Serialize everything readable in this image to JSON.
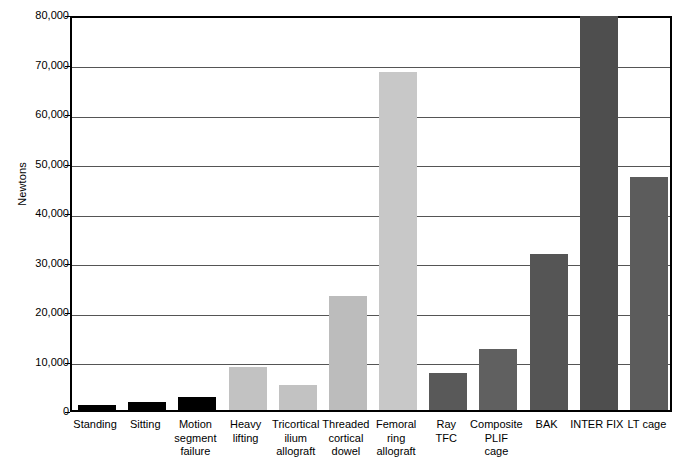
{
  "chart_data": {
    "type": "bar",
    "title": "",
    "xlabel": "",
    "ylabel": "Newtons",
    "ylim": [
      0,
      80000
    ],
    "grid": true,
    "legend": "none",
    "y_ticks": [
      "0",
      "10,000",
      "20,000",
      "30,000",
      "40,000",
      "50,000",
      "60,000",
      "70,000",
      "80,000"
    ],
    "y_tick_values": [
      0,
      10000,
      20000,
      30000,
      40000,
      50000,
      60000,
      70000,
      80000
    ],
    "categories": [
      "Standing",
      "Sitting",
      "Motion\nsegment\nfailure",
      "Heavy\nlifting",
      "Tricortical\nilium\nallograft",
      "Threaded\ncortical\ndowel",
      "Femoral\nring\nallograft",
      "Ray\nTFC",
      "Composite\nPLIF\ncage",
      "BAK",
      "INTER FIX",
      "LT cage"
    ],
    "values": [
      1100,
      1600,
      2700,
      8700,
      5100,
      23000,
      68300,
      7500,
      12300,
      31500,
      79500,
      47000
    ],
    "bar_colors": [
      "#000000",
      "#000000",
      "#000000",
      "#c2c2c2",
      "#c2c2c2",
      "#bcbcbc",
      "#c8c8c8",
      "#595959",
      "#606060",
      "#555555",
      "#4e4e4e",
      "#5c5c5c"
    ]
  },
  "colors": {
    "axis": "#000000",
    "gridline": "#555555",
    "background": "#ffffff",
    "group_loading": "#000000",
    "group_graft": "#c4c4c4",
    "group_cage": "#575757"
  }
}
